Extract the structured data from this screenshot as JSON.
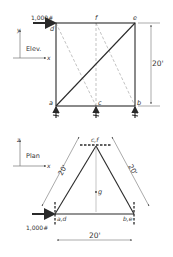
{
  "elevation": {
    "title": "Elev.",
    "axes": {
      "vertical": "y",
      "horizontal": "x"
    },
    "load_label": "1,000#",
    "nodes": {
      "a": "a",
      "b": "b",
      "c": "c",
      "d": "d",
      "e": "e",
      "f": "f"
    },
    "height_dim": "20'"
  },
  "plan": {
    "title": "Plan",
    "axes": {
      "vertical": "z",
      "horizontal": "x"
    },
    "load_label": "1,000#",
    "nodes": {
      "ad": "a,d",
      "be": "b,e",
      "cf": "c,f",
      "g": "g"
    },
    "left_side_dim": "20'",
    "right_side_dim": "20'",
    "base_dim": "20'"
  },
  "colors": {
    "line": "#2a2a2a",
    "dashed": "#9a9a9a",
    "dim": "#555555"
  }
}
